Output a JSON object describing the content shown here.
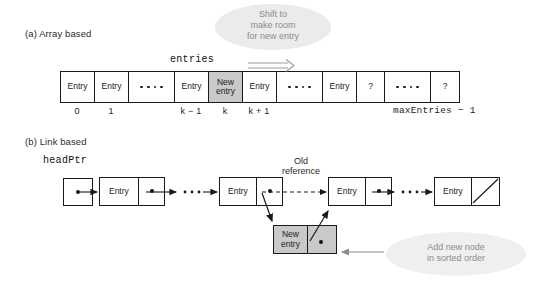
{
  "figure": {
    "caption_a": "(a) Array based",
    "caption_b": "(b) Link based"
  },
  "array_section": {
    "array_name": "entries",
    "callout": {
      "line1": "Shift to",
      "line2": "make room",
      "line3": "for new entry"
    },
    "shift_arrow_icon": "double-right-arrow-icon",
    "cells": [
      {
        "kind": "entry",
        "label": "Entry",
        "shaded": false,
        "index": "0"
      },
      {
        "kind": "entry",
        "label": "Entry",
        "shaded": false,
        "index": "1"
      },
      {
        "kind": "dots",
        "label": "",
        "shaded": false,
        "index": ""
      },
      {
        "kind": "entry",
        "label": "Entry",
        "shaded": false,
        "index": "k − 1"
      },
      {
        "kind": "entry",
        "label": "New\nentry",
        "shaded": true,
        "index": "k"
      },
      {
        "kind": "entry",
        "label": "Entry",
        "shaded": false,
        "index": "k + 1"
      },
      {
        "kind": "dots",
        "label": "",
        "shaded": false,
        "index": ""
      },
      {
        "kind": "entry",
        "label": "Entry",
        "shaded": false,
        "index": ""
      },
      {
        "kind": "entry",
        "label": "?",
        "shaded": false,
        "index": ""
      },
      {
        "kind": "dots",
        "label": "",
        "shaded": false,
        "index": ""
      },
      {
        "kind": "entry",
        "label": "?",
        "shaded": false,
        "index": ""
      }
    ],
    "last_index_label": "maxEntries − 1"
  },
  "link_section": {
    "head_pointer_label": "headPtr",
    "old_reference_label": {
      "line1": "Old",
      "line2": "reference"
    },
    "callout": {
      "line1": "Add new node",
      "line2": "in sorted order"
    },
    "nodes": [
      {
        "id": "node-1",
        "label": "Entry",
        "shaded": false,
        "null_slash": false
      },
      {
        "id": "node-2",
        "label": "Entry",
        "shaded": false,
        "null_slash": false
      },
      {
        "id": "node-3",
        "label": "Entry",
        "shaded": false,
        "null_slash": false
      },
      {
        "id": "node-4",
        "label": "Entry",
        "shaded": false,
        "null_slash": true
      }
    ],
    "new_node": {
      "label": "New\nentry",
      "shaded": true
    }
  },
  "colors": {
    "stroke": "#1a1a1a",
    "shade": "#c9c9c9",
    "callout_bg": "#ebebeb",
    "callout_text": "#8c8c8c",
    "background": "#ffffff"
  }
}
